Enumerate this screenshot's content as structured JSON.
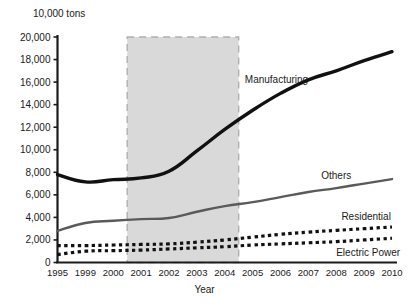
{
  "chart_data": {
    "type": "line",
    "title": "",
    "unit_label": "10,000 tons",
    "xlabel": "Year",
    "ylabel": "",
    "categories": [
      "1995",
      "1999",
      "2000",
      "2001",
      "2002",
      "2003",
      "2004",
      "2005",
      "2006",
      "2007",
      "2008",
      "2009",
      "2010"
    ],
    "ylim": [
      0,
      20000
    ],
    "yticks": [
      0,
      2000,
      4000,
      6000,
      8000,
      10000,
      12000,
      14000,
      16000,
      18000,
      20000
    ],
    "ytick_labels": [
      "0",
      "2,000",
      "4,000",
      "6,000",
      "8,000",
      "10,000",
      "12,000",
      "14,000",
      "16,000",
      "18,000",
      "20,000"
    ],
    "grid": false,
    "legend": "inline-annotations",
    "series": [
      {
        "name": "Manufacturing",
        "style": "solid-thick-black",
        "color": "#111111",
        "values": [
          7800,
          7150,
          7350,
          7500,
          8100,
          9900,
          11800,
          13500,
          15000,
          16200,
          17000,
          17900,
          18700
        ]
      },
      {
        "name": "Others",
        "style": "solid-gray",
        "color": "#5a5a5a",
        "values": [
          2800,
          3500,
          3700,
          3850,
          3950,
          4500,
          5000,
          5350,
          5800,
          6250,
          6600,
          7000,
          7400
        ]
      },
      {
        "name": "Residential",
        "style": "dotted-thick-black",
        "color": "#111111",
        "values": [
          1500,
          1500,
          1550,
          1600,
          1650,
          1800,
          2000,
          2250,
          2500,
          2700,
          2850,
          3000,
          3150
        ]
      },
      {
        "name": "Electric Power",
        "style": "dotted-thick-black",
        "color": "#111111",
        "values": [
          700,
          1000,
          1050,
          1100,
          1200,
          1300,
          1400,
          1550,
          1650,
          1750,
          1850,
          2000,
          2150
        ]
      }
    ],
    "shaded_band": {
      "label": "",
      "color": "#d9d9d9",
      "border_style": "dashed",
      "border_color": "#b0b0b0",
      "start_category": "2001",
      "end_category": "2005"
    },
    "annotations": [
      {
        "text": "Manufacturing",
        "series": "Manufacturing"
      },
      {
        "text": "Others",
        "series": "Others"
      },
      {
        "text": "Residential",
        "series": "Residential"
      },
      {
        "text": "Electric Power",
        "series": "Electric Power"
      }
    ]
  }
}
